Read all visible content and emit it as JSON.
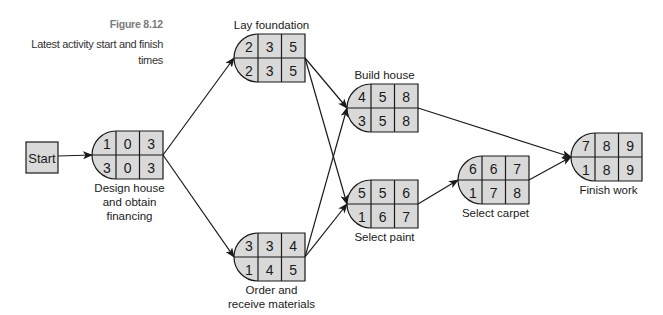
{
  "caption": {
    "figure_label": "Figure 8.12",
    "description": "Latest activity start and finish times"
  },
  "colors": {
    "node_fill": "#d9d9d9",
    "stroke": "#1a1a1a",
    "figure_label": "#7a7a7a"
  },
  "start_node": {
    "label": "Start"
  },
  "nodes": [
    {
      "id": "design",
      "label_lines": [
        "Design house",
        "and obtain",
        "financing"
      ],
      "top": [
        "1",
        "0",
        "3"
      ],
      "bottom": [
        "3",
        "0",
        "3"
      ]
    },
    {
      "id": "foundation",
      "label_lines": [
        "Lay foundation"
      ],
      "top": [
        "2",
        "3",
        "5"
      ],
      "bottom": [
        "2",
        "3",
        "5"
      ]
    },
    {
      "id": "materials",
      "label_lines": [
        "Order and",
        "receive materials"
      ],
      "top": [
        "3",
        "3",
        "4"
      ],
      "bottom": [
        "1",
        "4",
        "5"
      ]
    },
    {
      "id": "build",
      "label_lines": [
        "Build house"
      ],
      "top": [
        "4",
        "5",
        "8"
      ],
      "bottom": [
        "3",
        "5",
        "8"
      ]
    },
    {
      "id": "paint",
      "label_lines": [
        "Select paint"
      ],
      "top": [
        "5",
        "5",
        "6"
      ],
      "bottom": [
        "1",
        "6",
        "7"
      ]
    },
    {
      "id": "carpet",
      "label_lines": [
        "Select carpet"
      ],
      "top": [
        "6",
        "6",
        "7"
      ],
      "bottom": [
        "1",
        "7",
        "8"
      ]
    },
    {
      "id": "finish",
      "label_lines": [
        "Finish work"
      ],
      "top": [
        "7",
        "8",
        "9"
      ],
      "bottom": [
        "1",
        "8",
        "9"
      ]
    }
  ],
  "edges": [
    [
      "start",
      "design"
    ],
    [
      "design",
      "foundation"
    ],
    [
      "design",
      "materials"
    ],
    [
      "foundation",
      "build"
    ],
    [
      "foundation",
      "paint"
    ],
    [
      "materials",
      "build"
    ],
    [
      "materials",
      "paint"
    ],
    [
      "build",
      "finish"
    ],
    [
      "paint",
      "carpet"
    ],
    [
      "carpet",
      "finish"
    ]
  ]
}
